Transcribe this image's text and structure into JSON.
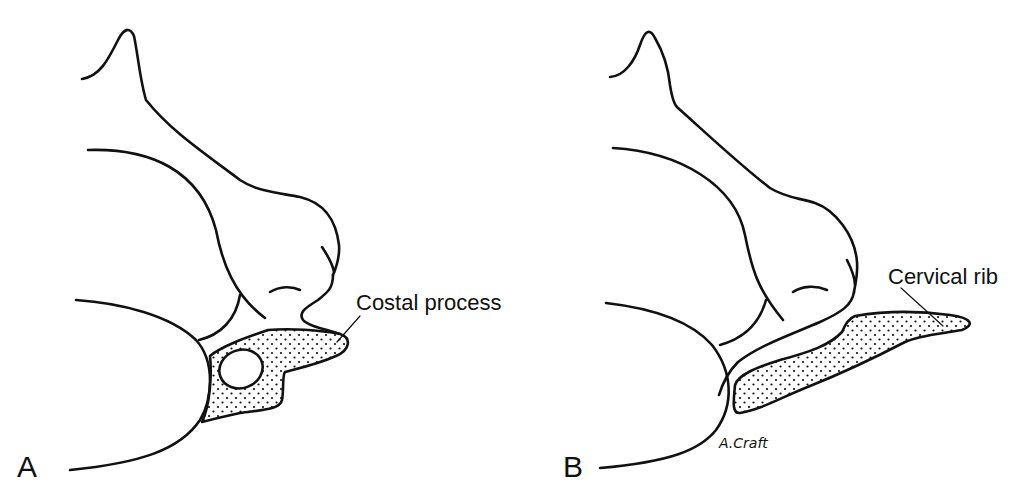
{
  "figure": {
    "panels": [
      {
        "id": "A",
        "label": "A",
        "annotation": "Costal process"
      },
      {
        "id": "B",
        "label": "B",
        "annotation": "Cervical rib"
      }
    ],
    "signature": "A.Craft",
    "colors": {
      "line": "#111111",
      "background": "#ffffff"
    }
  }
}
